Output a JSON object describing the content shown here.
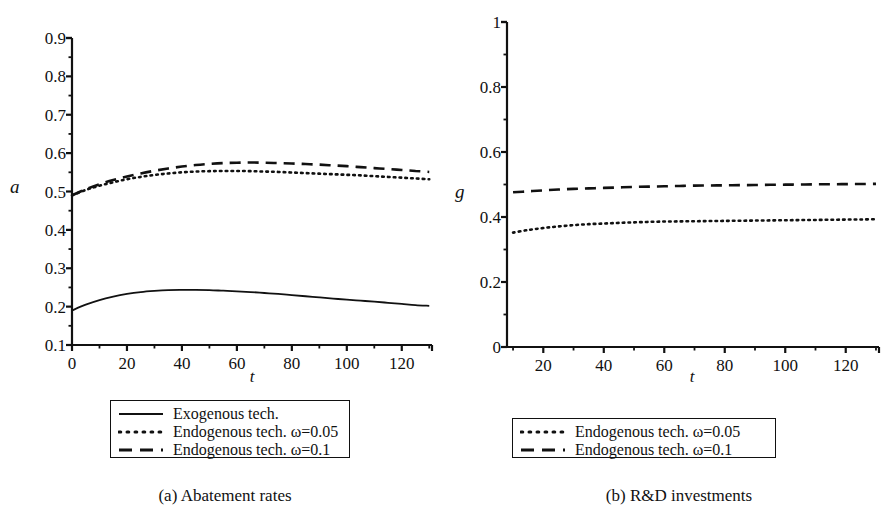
{
  "figure": {
    "panels": [
      {
        "id": "a",
        "caption": "(a) Abatement rates",
        "xlabel": "t",
        "ylabel": "a"
      },
      {
        "id": "b",
        "caption": "(b) R&D investments",
        "xlabel": "t",
        "ylabel": "g"
      }
    ]
  },
  "legend_a": {
    "items": [
      {
        "label": "Exogenous tech.",
        "style": "solid"
      },
      {
        "label": "Endogenous tech. ω=0.05",
        "style": "dotted"
      },
      {
        "label": "Endogenous tech. ω=0.1",
        "style": "dashed"
      }
    ]
  },
  "legend_b": {
    "items": [
      {
        "label": "Endogenous tech. ω=0.05",
        "style": "dotted"
      },
      {
        "label": "Endogenous tech. ω=0.1",
        "style": "dashed"
      }
    ]
  },
  "colors": {
    "line": "#111111",
    "axis": "#111111",
    "background": "#ffffff"
  },
  "chart_data": [
    {
      "type": "line",
      "id": "a",
      "title": "(a) Abatement rates",
      "xlabel": "t",
      "ylabel": "a",
      "xlim": [
        0,
        131
      ],
      "ylim": [
        0.1,
        0.9
      ],
      "grid": false,
      "legend_position": "below-plot",
      "xticks": [
        0,
        20,
        40,
        60,
        80,
        100,
        120
      ],
      "xtick_labels": [
        "0",
        "20",
        "40",
        "60",
        "80",
        "100",
        "120"
      ],
      "xminor_step": 10,
      "yticks": [
        0.1,
        0.2,
        0.3,
        0.4,
        0.5,
        0.6,
        0.7,
        0.8,
        0.9
      ],
      "ytick_labels": [
        "0.1",
        "0.2",
        "0.3",
        "0.4",
        "0.5",
        "0.6",
        "0.7",
        "0.8",
        "0.9"
      ],
      "yminor_step": 0.05,
      "x": [
        0,
        5,
        10,
        15,
        20,
        25,
        30,
        35,
        40,
        45,
        50,
        55,
        60,
        65,
        70,
        75,
        80,
        85,
        90,
        95,
        100,
        105,
        110,
        115,
        120,
        125,
        130
      ],
      "series": [
        {
          "name": "Exogenous tech.",
          "style": "solid",
          "values": [
            0.19,
            0.205,
            0.217,
            0.226,
            0.233,
            0.238,
            0.241,
            0.243,
            0.2435,
            0.2435,
            0.243,
            0.2415,
            0.24,
            0.238,
            0.2355,
            0.233,
            0.23,
            0.227,
            0.224,
            0.221,
            0.218,
            0.2155,
            0.213,
            0.21,
            0.207,
            0.204,
            0.202
          ]
        },
        {
          "name": "Endogenous tech. ω=0.05",
          "style": "dotted",
          "values": [
            0.49,
            0.504,
            0.515,
            0.524,
            0.532,
            0.538,
            0.543,
            0.547,
            0.55,
            0.552,
            0.553,
            0.5535,
            0.5535,
            0.553,
            0.552,
            0.551,
            0.5495,
            0.548,
            0.5465,
            0.545,
            0.5435,
            0.542,
            0.54,
            0.538,
            0.536,
            0.534,
            0.532
          ]
        },
        {
          "name": "Endogenous tech. ω=0.1",
          "style": "dashed",
          "values": [
            0.49,
            0.506,
            0.519,
            0.53,
            0.539,
            0.547,
            0.554,
            0.56,
            0.565,
            0.569,
            0.572,
            0.574,
            0.575,
            0.5755,
            0.575,
            0.574,
            0.573,
            0.5715,
            0.57,
            0.568,
            0.566,
            0.5635,
            0.561,
            0.5585,
            0.556,
            0.5535,
            0.551
          ]
        }
      ]
    },
    {
      "type": "line",
      "id": "b",
      "title": "(b) R&D investments",
      "xlabel": "t",
      "ylabel": "g",
      "xlim": [
        8,
        131
      ],
      "ylim": [
        0,
        1
      ],
      "grid": false,
      "legend_position": "below-plot",
      "xticks": [
        20,
        40,
        60,
        80,
        100,
        120
      ],
      "xtick_labels": [
        "20",
        "40",
        "60",
        "80",
        "100",
        "120"
      ],
      "xminor_step": 10,
      "yticks": [
        0,
        0.2,
        0.4,
        0.6,
        0.8,
        1
      ],
      "ytick_labels": [
        "0",
        "0.2",
        "0.4",
        "0.6",
        "0.8",
        "1"
      ],
      "yminor_step": 0.1,
      "x": [
        10,
        15,
        20,
        25,
        30,
        35,
        40,
        45,
        50,
        55,
        60,
        65,
        70,
        75,
        80,
        85,
        90,
        95,
        100,
        105,
        110,
        115,
        120,
        125,
        130
      ],
      "series": [
        {
          "name": "Endogenous tech. ω=0.05",
          "style": "dotted",
          "values": [
            0.352,
            0.36,
            0.366,
            0.371,
            0.375,
            0.378,
            0.38,
            0.382,
            0.3835,
            0.385,
            0.386,
            0.3865,
            0.387,
            0.3875,
            0.388,
            0.3885,
            0.389,
            0.3895,
            0.39,
            0.3905,
            0.391,
            0.3915,
            0.392,
            0.3925,
            0.393
          ]
        },
        {
          "name": "Endogenous tech. ω=0.1",
          "style": "dashed",
          "values": [
            0.476,
            0.479,
            0.482,
            0.4845,
            0.4865,
            0.488,
            0.4895,
            0.491,
            0.4925,
            0.4935,
            0.4945,
            0.4955,
            0.4965,
            0.497,
            0.4975,
            0.498,
            0.4985,
            0.499,
            0.4995,
            0.5,
            0.5005,
            0.5008,
            0.5012,
            0.5015,
            0.502
          ]
        }
      ]
    }
  ]
}
